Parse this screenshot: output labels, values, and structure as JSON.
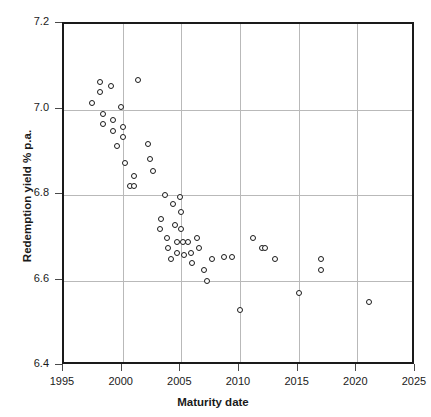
{
  "chart_data": {
    "type": "scatter",
    "title": "",
    "xlabel": "Maturity date",
    "ylabel": "Redemption yield % p.a.",
    "xlim": [
      1995,
      2025
    ],
    "ylim": [
      6.4,
      7.2
    ],
    "xticks": [
      1995,
      2000,
      2005,
      2010,
      2015,
      2020,
      2025
    ],
    "yticks": [
      "6.4",
      "6.6",
      "6.8",
      "7.0",
      "7.2"
    ],
    "grid": true,
    "legend": "none",
    "marker": "open-circle",
    "series": [
      {
        "name": "Gilts",
        "points": [
          [
            1997.4,
            7.015
          ],
          [
            1998.1,
            7.065
          ],
          [
            1998.1,
            7.04
          ],
          [
            1998.3,
            6.99
          ],
          [
            1998.3,
            6.965
          ],
          [
            1999.0,
            7.055
          ],
          [
            1999.2,
            6.975
          ],
          [
            1999.2,
            6.95
          ],
          [
            1999.5,
            6.915
          ],
          [
            1999.9,
            7.005
          ],
          [
            2000.0,
            6.96
          ],
          [
            2000.0,
            6.935
          ],
          [
            2000.2,
            6.875
          ],
          [
            2000.6,
            6.82
          ],
          [
            2001.0,
            6.845
          ],
          [
            2001.0,
            6.82
          ],
          [
            2001.3,
            7.07
          ],
          [
            2002.2,
            6.92
          ],
          [
            2002.3,
            6.885
          ],
          [
            2002.6,
            6.855
          ],
          [
            2003.2,
            6.72
          ],
          [
            2003.3,
            6.745
          ],
          [
            2003.6,
            6.8
          ],
          [
            2003.8,
            6.7
          ],
          [
            2003.9,
            6.675
          ],
          [
            2004.1,
            6.65
          ],
          [
            2004.3,
            6.78
          ],
          [
            2004.5,
            6.73
          ],
          [
            2004.6,
            6.69
          ],
          [
            2004.6,
            6.665
          ],
          [
            2004.9,
            6.795
          ],
          [
            2005.0,
            6.76
          ],
          [
            2005.0,
            6.72
          ],
          [
            2005.1,
            6.69
          ],
          [
            2005.2,
            6.66
          ],
          [
            2005.6,
            6.69
          ],
          [
            2005.8,
            6.665
          ],
          [
            2005.9,
            6.64
          ],
          [
            2006.3,
            6.7
          ],
          [
            2006.5,
            6.675
          ],
          [
            2006.9,
            6.625
          ],
          [
            2007.2,
            6.6
          ],
          [
            2007.6,
            6.65
          ],
          [
            2008.6,
            6.655
          ],
          [
            2009.3,
            6.655
          ],
          [
            2010.0,
            6.53
          ],
          [
            2011.1,
            6.7
          ],
          [
            2011.9,
            6.675
          ],
          [
            2012.1,
            6.675
          ],
          [
            2013.0,
            6.65
          ],
          [
            2015.0,
            6.57
          ],
          [
            2016.9,
            6.65
          ],
          [
            2016.9,
            6.625
          ],
          [
            2021.0,
            6.55
          ]
        ]
      }
    ]
  },
  "axis": {
    "y_tick_labels": [
      "7.2",
      "7.0",
      "6.8",
      "6.6",
      "6.4"
    ],
    "x_tick_labels": [
      "1995",
      "2000",
      "2005",
      "2010",
      "2015",
      "2020",
      "2025"
    ]
  }
}
